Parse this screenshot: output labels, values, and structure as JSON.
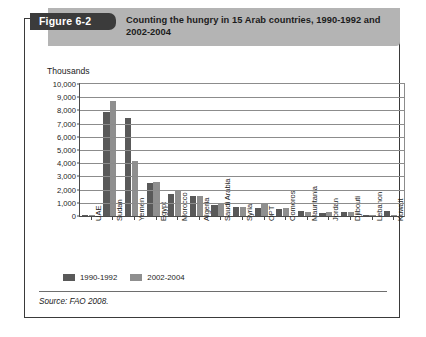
{
  "figure": {
    "tab_label": "Figure 6-2",
    "title": "Counting the hungry in 15 Arab countries, 1990-1992 and 2002-2004",
    "source": "Source: FAO 2008.",
    "colors": {
      "tab_background": "#3b3b3b",
      "header_background": "#b4b4b4",
      "series_1990_1992": "#595959",
      "series_2002_2004": "#8f8f8f",
      "frame": "#3a3a3a"
    }
  },
  "chart_data": {
    "type": "bar",
    "title": "Counting the hungry in 15 Arab countries, 1990-1992 and 2002-2004",
    "xlabel": "",
    "ylabel": "Thousands",
    "ylim": [
      0,
      10000
    ],
    "ytick_labels": [
      "10,000",
      "9,000",
      "8,000",
      "7,000",
      "6,000",
      "5,000",
      "4,000",
      "3,000",
      "2,000",
      "1,000",
      "0"
    ],
    "ytick_values": [
      10000,
      9000,
      8000,
      7000,
      6000,
      5000,
      4000,
      3000,
      2000,
      1000,
      0
    ],
    "grid": true,
    "legend_position": "below-left",
    "categories": [
      "UAE",
      "Sudan",
      "Yemen",
      "Egypt",
      "Morocco",
      "Algeria",
      "Saudi Arabia",
      "Syria",
      "OPT",
      "Comoros",
      "Mauritania",
      "Jordan",
      "Djibouti",
      "Lebanon",
      "Kuwait"
    ],
    "series": [
      {
        "name": "1990-1992",
        "color": "#595959",
        "values": [
          100,
          7900,
          7400,
          2500,
          1700,
          1500,
          800,
          700,
          600,
          500,
          400,
          200,
          300,
          100,
          400
        ]
      },
      {
        "name": "2002-2004",
        "color": "#8f8f8f",
        "values": [
          60,
          8700,
          4200,
          2600,
          2000,
          1500,
          900,
          700,
          900,
          600,
          300,
          300,
          300,
          100,
          80
        ]
      }
    ]
  }
}
